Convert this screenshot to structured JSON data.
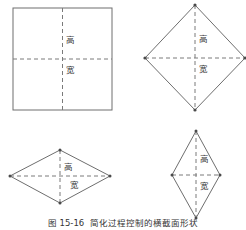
{
  "figure": {
    "caption_number": "图 15-16",
    "caption_title": "简化过程控制的横截面形状",
    "label_height": "高",
    "label_width": "宽",
    "line_color": "#6e6e6e",
    "axis_color": "#7a7a7a",
    "background_color": "#ffffff"
  },
  "shapes": [
    {
      "id": "square",
      "name": "正方形",
      "type": "square",
      "label_height": "高",
      "label_width": "宽",
      "has_vertex_dots": false,
      "vertices_px": [
        [
          13,
          8
        ],
        [
          112,
          8
        ],
        [
          112,
          110
        ],
        [
          13,
          110
        ]
      ],
      "center_px": [
        62.5,
        59
      ],
      "width_px": 99,
      "height_px": 102
    },
    {
      "id": "diamond",
      "name": "菱形(正方形旋转45度)",
      "type": "diamond-equal",
      "label_height": "高",
      "label_width": "宽",
      "has_vertex_dots": true,
      "vertices_px": [
        [
          195,
          5
        ],
        [
          245,
          58
        ],
        [
          195,
          110
        ],
        [
          145,
          58
        ]
      ],
      "center_px": [
        195,
        58
      ],
      "width_px": 100,
      "height_px": 105
    },
    {
      "id": "wide-rhombus",
      "name": "扁平菱形",
      "type": "rhombus-wide",
      "label_height": "高",
      "label_width": "宽",
      "has_vertex_dots": true,
      "vertices_px": [
        [
          60,
          150
        ],
        [
          110,
          176
        ],
        [
          60,
          203
        ],
        [
          10,
          176
        ]
      ],
      "center_px": [
        60,
        176
      ],
      "width_px": 100,
      "height_px": 53
    },
    {
      "id": "tall-rhombus",
      "name": "竖长菱形",
      "type": "rhombus-tall",
      "label_height": "高",
      "label_width": "宽",
      "has_vertex_dots": true,
      "vertices_px": [
        [
          196,
          131
        ],
        [
          220,
          175
        ],
        [
          196,
          218
        ],
        [
          172,
          175
        ]
      ],
      "center_px": [
        196,
        175
      ],
      "width_px": 48,
      "height_px": 87
    }
  ]
}
